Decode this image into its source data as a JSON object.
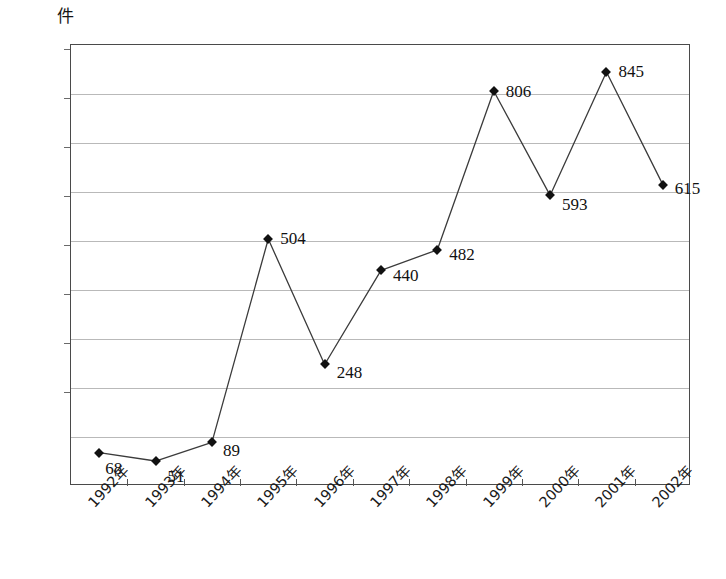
{
  "chart_data": {
    "type": "line",
    "title": "",
    "subtitle": "",
    "xlabel": "",
    "ylabel": "件",
    "unit_label": "件",
    "categories": [
      "1992年",
      "1993年",
      "1994年",
      "1995年",
      "1996年",
      "1997年",
      "1998年",
      "1999年",
      "2000年",
      "2001年",
      "2002年"
    ],
    "values": [
      68,
      51,
      89,
      504,
      248,
      440,
      482,
      806,
      593,
      845,
      615
    ],
    "point_labels": [
      "68",
      "51",
      "89",
      "504",
      "248",
      "440",
      "482",
      "806",
      "593",
      "845",
      "615"
    ],
    "ylim": [
      0,
      900
    ],
    "ytick_step": 100,
    "ytick_labels": [
      "900",
      "800",
      "700",
      "600",
      "500",
      "400",
      "300",
      "200",
      "100",
      "0"
    ],
    "yticks": [
      900,
      800,
      700,
      600,
      500,
      400,
      300,
      200,
      100,
      0
    ],
    "grid": true,
    "grid_axis": "y",
    "legend": false,
    "legend_position": "none",
    "marker": "diamond",
    "series": [
      {
        "name": "件数",
        "values": [
          68,
          51,
          89,
          504,
          248,
          440,
          482,
          806,
          593,
          845,
          615
        ]
      }
    ],
    "label_offsets": [
      {
        "dx": 6,
        "dy": 17
      },
      {
        "dx": 12,
        "dy": 17
      },
      {
        "dx": 11,
        "dy": 10
      },
      {
        "dx": 12,
        "dy": 1
      },
      {
        "dx": 12,
        "dy": 10
      },
      {
        "dx": 12,
        "dy": 7
      },
      {
        "dx": 12,
        "dy": 6
      },
      {
        "dx": 12,
        "dy": 2
      },
      {
        "dx": 12,
        "dy": 11
      },
      {
        "dx": 12,
        "dy": 1
      },
      {
        "dx": 12,
        "dy": 5
      }
    ]
  },
  "colors": {
    "line": "#3b3b3b",
    "marker": "#111111",
    "grid": "#b9b9b9",
    "axis": "#4a4a4a",
    "text": "#1a1a1a",
    "background": "#ffffff"
  }
}
